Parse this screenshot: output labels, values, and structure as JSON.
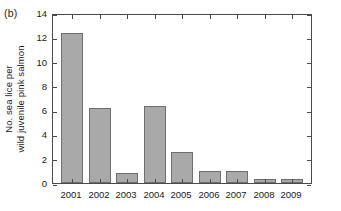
{
  "figure": {
    "panel_label": "(b)",
    "background_color": "#ffffff",
    "frame_color": "#4a4a4a"
  },
  "chart_data": {
    "type": "bar",
    "title": "",
    "subtitle": "",
    "panel_label": "(b)",
    "categories": [
      "2001",
      "2002",
      "2003",
      "2004",
      "2005",
      "2006",
      "2007",
      "2008",
      "2009"
    ],
    "values": [
      12.4,
      6.2,
      0.8,
      6.35,
      2.6,
      1.0,
      1.0,
      0.3,
      0.3
    ],
    "series": [
      {
        "name": "No. sea lice per wild juvenile pink salmon",
        "values": [
          12.4,
          6.2,
          0.8,
          6.35,
          2.6,
          1.0,
          1.0,
          0.3,
          0.3
        ]
      }
    ],
    "xlabel": "",
    "ylabel": "No. sea lice per wild juvenile pink salmon",
    "ylabel_line1": "No. sea lice per",
    "ylabel_line2": "wild juvenile pink salmon",
    "ylim": [
      0,
      14
    ],
    "yticks": [
      0,
      2,
      4,
      6,
      8,
      10,
      12,
      14
    ],
    "ytick_labels": [
      "0",
      "2",
      "4",
      "6",
      "8",
      "10",
      "12",
      "14"
    ],
    "xtick_labels": [
      "2001",
      "2002",
      "2003",
      "2004",
      "2005",
      "2006",
      "2007",
      "2008",
      "2009"
    ],
    "grid": false,
    "legend": null,
    "legend_position": "none",
    "bar_fill_color": "#a9a9a9",
    "bar_edge_color": "#6e6e6e",
    "annotations": []
  }
}
